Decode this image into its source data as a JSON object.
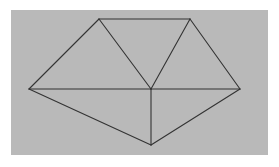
{
  "image": {
    "width": 279,
    "height": 167,
    "page_background": "#ffffff",
    "plate_background": "#b9b9b9",
    "plate_rect": {
      "x": 11,
      "y": 10,
      "width": 257,
      "height": 145
    },
    "caption": ""
  },
  "figure": {
    "name": "triangulated-polygon-diagram",
    "stroke_color": "#333333",
    "stroke_width": 1.1,
    "vertices": [
      {
        "id": "left-apex",
        "label": "left apex",
        "x": 29,
        "y": 89
      },
      {
        "id": "top-left",
        "label": "top left",
        "x": 99,
        "y": 19
      },
      {
        "id": "top-right",
        "label": "top right",
        "x": 190,
        "y": 19
      },
      {
        "id": "right-apex",
        "label": "right apex",
        "x": 240,
        "y": 89
      },
      {
        "id": "bottom-apex",
        "label": "bottom apex",
        "x": 151,
        "y": 145
      },
      {
        "id": "center",
        "label": "center",
        "x": 151,
        "y": 89
      }
    ],
    "edges": [
      {
        "id": "edge-left-upper",
        "from": "left-apex",
        "to": "top-left",
        "kind": "outline"
      },
      {
        "id": "edge-top",
        "from": "top-left",
        "to": "top-right",
        "kind": "outline"
      },
      {
        "id": "edge-right-upper",
        "from": "top-right",
        "to": "right-apex",
        "kind": "outline"
      },
      {
        "id": "edge-right-lower",
        "from": "right-apex",
        "to": "bottom-apex",
        "kind": "outline"
      },
      {
        "id": "edge-left-lower",
        "from": "bottom-apex",
        "to": "left-apex",
        "kind": "outline"
      },
      {
        "id": "edge-horizontal-left",
        "from": "left-apex",
        "to": "center",
        "kind": "internal"
      },
      {
        "id": "edge-horizontal-right",
        "from": "center",
        "to": "right-apex",
        "kind": "internal"
      },
      {
        "id": "edge-spoke-top-left",
        "from": "center",
        "to": "top-left",
        "kind": "internal"
      },
      {
        "id": "edge-spoke-top-right",
        "from": "center",
        "to": "top-right",
        "kind": "internal"
      },
      {
        "id": "edge-spoke-bottom",
        "from": "center",
        "to": "bottom-apex",
        "kind": "internal"
      }
    ]
  }
}
